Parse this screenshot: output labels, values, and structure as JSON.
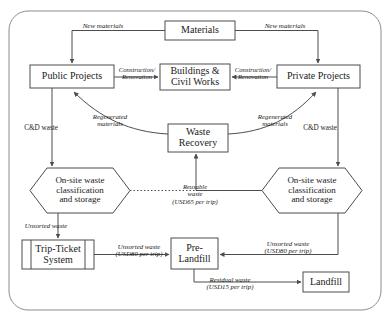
{
  "diagram": {
    "style": {
      "stroke": "#4d4d4d",
      "fill": "#ffffff",
      "text": "#1a1a1a",
      "frame_stroke": "#8c8c8c"
    },
    "nodes": [
      {
        "id": "materials",
        "label": "Materials",
        "shape": "rect",
        "x": 165,
        "y": 21,
        "w": 70,
        "h": 19,
        "font": 10
      },
      {
        "id": "public-projects",
        "label": "Public Projects",
        "shape": "rect",
        "x": 30,
        "y": 65,
        "w": 84,
        "h": 23,
        "font": 10
      },
      {
        "id": "buildings-civil-works",
        "label": "Buildings &\nCivil Works",
        "shape": "rect",
        "x": 160,
        "y": 64,
        "w": 70,
        "h": 26,
        "font": 10
      },
      {
        "id": "private-projects",
        "label": "Private Projects",
        "shape": "rect",
        "x": 277,
        "y": 65,
        "w": 83,
        "h": 23,
        "font": 10
      },
      {
        "id": "waste-recovery",
        "label": "Waste\nRecovery",
        "shape": "rect",
        "x": 168,
        "y": 124,
        "w": 60,
        "h": 28,
        "font": 10
      },
      {
        "id": "onsite-left",
        "label": "On-site waste\nclassification\nand storage",
        "shape": "hexagon",
        "x": 30,
        "y": 168,
        "w": 100,
        "h": 45,
        "font": 9
      },
      {
        "id": "onsite-right",
        "label": "On-site waste\nclassification\nand storage",
        "shape": "hexagon",
        "x": 262,
        "y": 168,
        "w": 100,
        "h": 45,
        "font": 9
      },
      {
        "id": "trip-ticket",
        "label": "Trip-Ticket\nSystem",
        "shape": "predefined",
        "x": 22,
        "y": 240,
        "w": 72,
        "h": 29,
        "font": 10
      },
      {
        "id": "pre-landfill",
        "label": "Pre-\nLandfill",
        "shape": "rect",
        "x": 171,
        "y": 238,
        "w": 47,
        "h": 31,
        "font": 10
      },
      {
        "id": "landfill",
        "label": "Landfill",
        "shape": "rect",
        "x": 303,
        "y": 272,
        "w": 46,
        "h": 20,
        "font": 10
      }
    ],
    "edge_labels": [
      {
        "id": "new-materials-left",
        "text": "New materials",
        "x": 70,
        "y": 23,
        "w": 66,
        "font": 7.0,
        "italic": true
      },
      {
        "id": "new-materials-right",
        "text": "New materials",
        "x": 252,
        "y": 23,
        "w": 66,
        "font": 7.0,
        "italic": true
      },
      {
        "id": "construction-left",
        "text": "Construction/\nRenovation",
        "x": 114,
        "y": 66,
        "w": 46,
        "font": 6.6,
        "italic": true
      },
      {
        "id": "construction-right",
        "text": "Construction/\nRenovation",
        "x": 230,
        "y": 66,
        "w": 46,
        "font": 6.6,
        "italic": true
      },
      {
        "id": "cd-waste-left",
        "text": "C&D waste",
        "x": 16,
        "y": 125,
        "w": 50,
        "font": 7.2,
        "italic": false
      },
      {
        "id": "cd-waste-right",
        "text": "C&D waste",
        "x": 295,
        "y": 125,
        "w": 50,
        "font": 7.2,
        "italic": false
      },
      {
        "id": "regenerated-left",
        "text": "Regenerated\nmaterials",
        "x": 84,
        "y": 113,
        "w": 52,
        "font": 6.8,
        "italic": true
      },
      {
        "id": "regenerated-right",
        "text": "Regenerated\nmaterials",
        "x": 249,
        "y": 113,
        "w": 52,
        "font": 6.8,
        "italic": true
      },
      {
        "id": "reusable-waste",
        "text": "Reusable\nwaste\n(USD65 per trip)",
        "x": 158,
        "y": 183,
        "w": 74,
        "font": 6.6,
        "italic": true
      },
      {
        "id": "unsorted-waste-hex",
        "text": "Unsorted waste",
        "x": 14,
        "y": 222,
        "w": 64,
        "font": 6.8,
        "italic": true
      },
      {
        "id": "unsorted-waste-left",
        "text": "Unsorted waste\n(USD80 per trip)",
        "x": 106,
        "y": 243,
        "w": 66,
        "font": 6.8,
        "italic": true
      },
      {
        "id": "unsorted-waste-right",
        "text": "Unsorted waste\n(USD80 per trip)",
        "x": 255,
        "y": 240,
        "w": 66,
        "font": 6.8,
        "italic": true
      },
      {
        "id": "residual-waste",
        "text": "Residual waste\n(USD15 per trip)",
        "x": 197,
        "y": 276,
        "w": 66,
        "font": 6.8,
        "italic": true
      }
    ]
  }
}
